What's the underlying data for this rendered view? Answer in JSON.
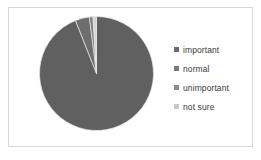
{
  "figure": {
    "background_color": "#ffffff",
    "border_color": "#d8d8d8"
  },
  "legend": {
    "position": "right",
    "items": [
      {
        "label": "important",
        "color": "#6b6b6b",
        "swatch_icon": "square-swatch-icon"
      },
      {
        "label": "normal",
        "color": "#7a7a7a",
        "swatch_icon": "square-swatch-icon"
      },
      {
        "label": "unimportant",
        "color": "#8c8c8c",
        "swatch_icon": "square-swatch-icon"
      },
      {
        "label": "not sure",
        "color": "#c9c9c9",
        "swatch_icon": "square-swatch-icon"
      }
    ]
  },
  "chart_data": {
    "type": "pie",
    "title": "",
    "subtitle": "",
    "xlabel": "",
    "ylabel": "",
    "grid": false,
    "legend_position": "right",
    "start_angle": 90,
    "direction": "clockwise",
    "categories": [
      "important",
      "normal",
      "unimportant",
      "not sure"
    ],
    "values": [
      94,
      4,
      1,
      1
    ],
    "unit": "percent",
    "colors": [
      "#606060",
      "#6e6e6e",
      "#7d7d7d",
      "#d5d5d5"
    ],
    "annotations": []
  }
}
